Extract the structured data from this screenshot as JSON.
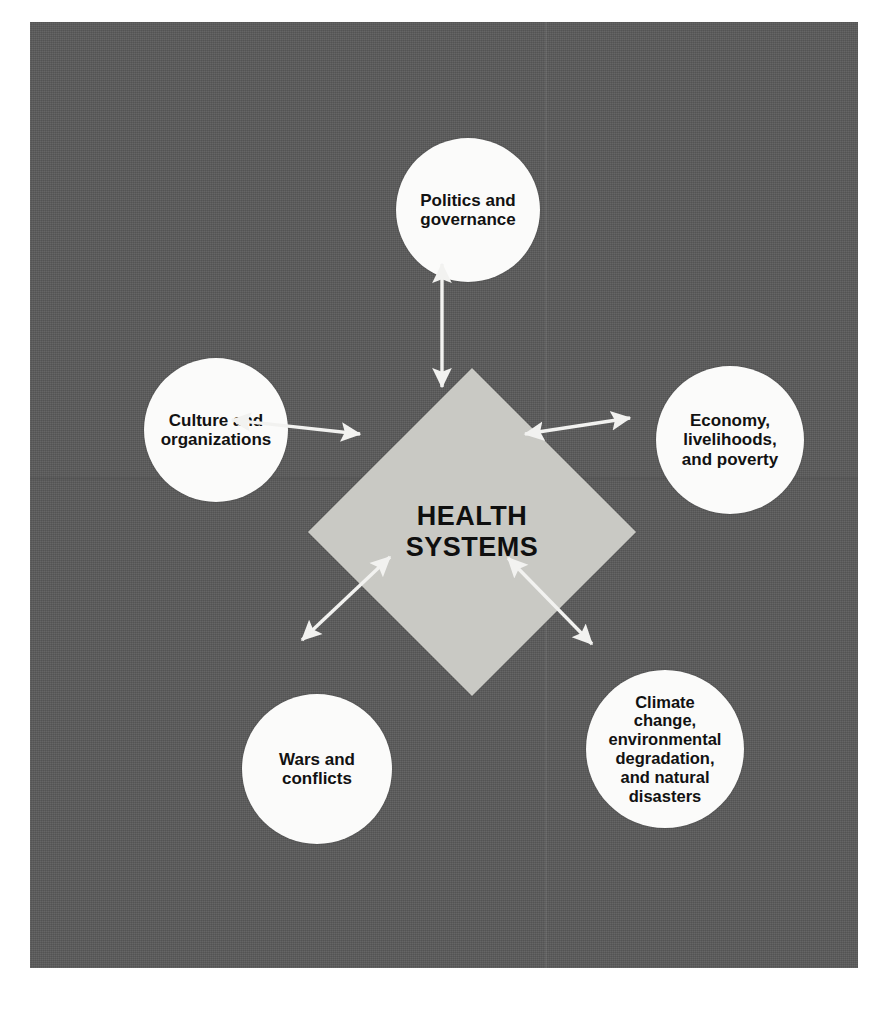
{
  "figure": {
    "background_color": "#5b5b5b",
    "node_fill_color": "#fbfbfa",
    "center_fill_color": "#c9c9c4",
    "arrow_color": "#f2f2f0",
    "text_color": "#121212"
  },
  "center": {
    "name": "health-systems",
    "label": "HEALTH\nSYSTEMS"
  },
  "nodes": [
    {
      "id": "politics",
      "label": "Politics and\ngovernance",
      "position": "top"
    },
    {
      "id": "culture",
      "label": "Culture and\norganizations",
      "position": "left"
    },
    {
      "id": "economy",
      "label": "Economy,\nlivelihoods,\nand poverty",
      "position": "right"
    },
    {
      "id": "wars",
      "label": "Wars and\nconflicts",
      "position": "bottom-left"
    },
    {
      "id": "climate",
      "label": "Climate\nchange,\nenvironmental\ndegradation,\nand natural\ndisasters",
      "position": "bottom-right"
    }
  ],
  "connectors": [
    {
      "id": "politics-link",
      "from": "politics",
      "to": "health-systems",
      "style": "double-headed-arrow",
      "orientation": "vertical"
    },
    {
      "id": "culture-link",
      "from": "culture",
      "to": "health-systems",
      "style": "double-headed-arrow",
      "orientation": "horizontal"
    },
    {
      "id": "economy-link",
      "from": "economy",
      "to": "health-systems",
      "style": "double-headed-arrow",
      "orientation": "horizontal"
    },
    {
      "id": "wars-link",
      "from": "wars",
      "to": "health-systems",
      "style": "double-headed-arrow",
      "orientation": "diagonal"
    },
    {
      "id": "climate-link",
      "from": "climate",
      "to": "health-systems",
      "style": "double-headed-arrow",
      "orientation": "diagonal"
    }
  ],
  "caption": {
    "text": ""
  }
}
